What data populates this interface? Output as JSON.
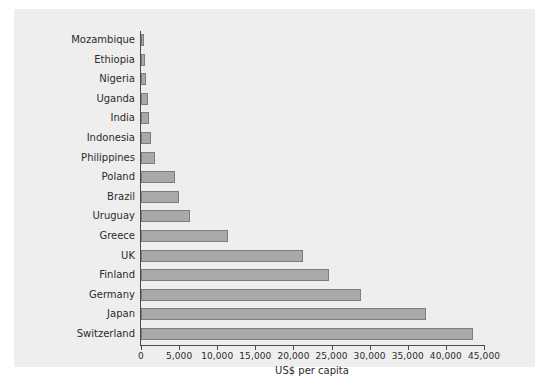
{
  "chart_data": {
    "type": "bar",
    "orientation": "horizontal",
    "title": "",
    "xlabel": "US$ per capita",
    "ylabel": "",
    "xlim": [
      0,
      45000
    ],
    "xticks": [
      0,
      5000,
      10000,
      15000,
      20000,
      25000,
      30000,
      35000,
      40000,
      45000
    ],
    "xticklabels": [
      "0",
      "5,000",
      "10,000",
      "15,000",
      "20,000",
      "25,000",
      "30,000",
      "35,000",
      "40,000",
      "45,000"
    ],
    "grid": false,
    "legend": null,
    "bar_color": "#a9a9a9",
    "bar_edge_color": "#7d7d7d",
    "background_color": "#eeeeee",
    "categories": [
      "Mozambique",
      "Ethiopia",
      "Nigeria",
      "Uganda",
      "India",
      "Indonesia",
      "Philippines",
      "Poland",
      "Brazil",
      "Uruguay",
      "Greece",
      "UK",
      "Finland",
      "Germany",
      "Japan",
      "Switzerland"
    ],
    "values": [
      300,
      500,
      700,
      900,
      1000,
      1300,
      1800,
      4500,
      5000,
      6400,
      11400,
      21300,
      24600,
      28800,
      37400,
      43500
    ]
  }
}
